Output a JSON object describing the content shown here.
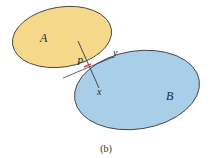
{
  "figure": {
    "caption": "(b)",
    "bodies": [
      {
        "id": "A",
        "label": "A",
        "fill": "#f5d88a",
        "stroke": "#2b2b2b"
      },
      {
        "id": "B",
        "label": "B",
        "fill": "#a9cfe8",
        "stroke": "#2b2b2b"
      }
    ],
    "contact_point": {
      "label": "P",
      "color": "#d9434e"
    },
    "axes": {
      "tangent_label": "y",
      "normal_label": "x"
    }
  }
}
